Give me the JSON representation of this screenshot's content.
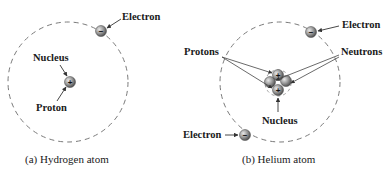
{
  "diagram": {
    "hydrogen": {
      "caption": "(a) Hydrogen atom",
      "labels": {
        "electron": "Electron",
        "nucleus": "Nucleus",
        "proton": "Proton"
      },
      "particles": {
        "electron_sign": "−",
        "proton_sign": "+"
      }
    },
    "helium": {
      "caption": "(b) Helium atom",
      "labels": {
        "electron_top": "Electron",
        "electron_bottom": "Electron",
        "protons": "Protons",
        "neutrons": "Neutrons",
        "nucleus": "Nucleus"
      },
      "particles": {
        "electron_sign": "−",
        "proton_sign": "+"
      }
    },
    "colors": {
      "orbit": "#7a7a7a",
      "particle_fill": "#9a9a9a",
      "particle_dark": "#555555",
      "arrow": "#333333",
      "text": "#1a1a1a"
    }
  }
}
